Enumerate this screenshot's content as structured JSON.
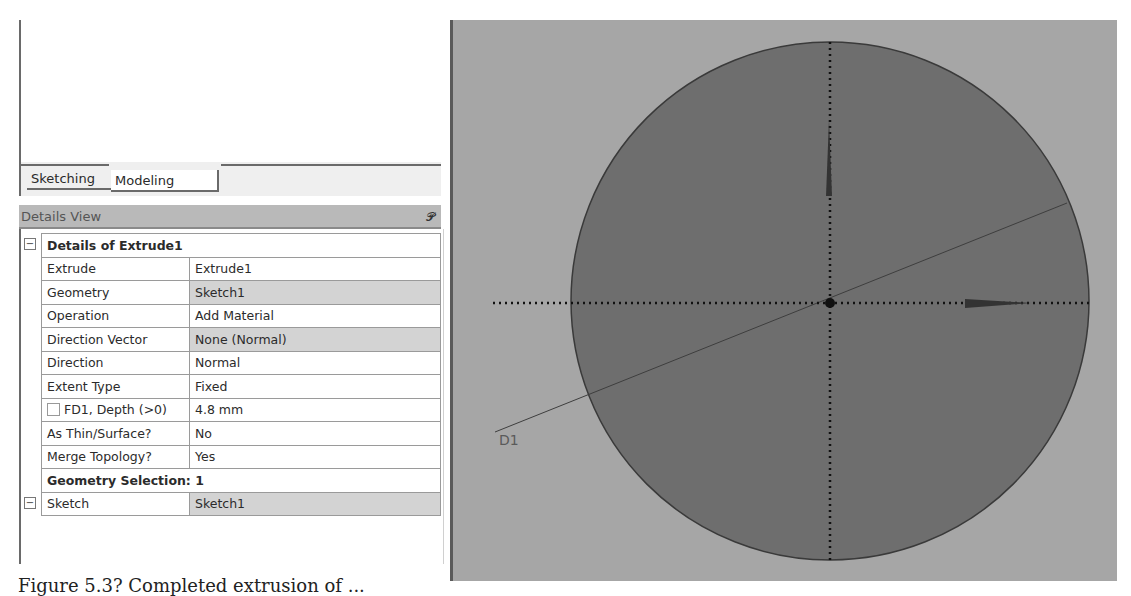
{
  "tabs": [
    {
      "label": "Sketching",
      "active": false
    },
    {
      "label": "Modeling",
      "active": true
    }
  ],
  "details_view": {
    "title": "Details View",
    "pin_icon": "pin-icon",
    "groups": [
      {
        "title": "Details of Extrude1",
        "expanded": true,
        "rows": [
          {
            "label": "Extrude",
            "value": "Extrude1",
            "shaded": false
          },
          {
            "label": "Geometry",
            "value": "Sketch1",
            "shaded": true
          },
          {
            "label": "Operation",
            "value": "Add Material",
            "shaded": false
          },
          {
            "label": "Direction Vector",
            "value": "None (Normal)",
            "shaded": true
          },
          {
            "label": "Direction",
            "value": "Normal",
            "shaded": false
          },
          {
            "label": "Extent Type",
            "value": "Fixed",
            "shaded": false
          },
          {
            "label": "FD1,  Depth (>0)",
            "value": "4.8 mm",
            "shaded": false,
            "checkbox": true
          },
          {
            "label": "As Thin/Surface?",
            "value": "No",
            "shaded": false
          },
          {
            "label": "Merge Topology?",
            "value": "Yes",
            "shaded": false
          }
        ]
      },
      {
        "title": "Geometry Selection: 1",
        "expanded": true,
        "rows": [
          {
            "label": "Sketch",
            "value": "Sketch1",
            "shaded": true
          }
        ]
      }
    ]
  },
  "graphics": {
    "dimension_label": "D1",
    "background_color": "#a6a6a6",
    "circle_fill": "#6e6e6e",
    "axis_icons": [
      "y-axis-arrow-icon",
      "x-axis-arrow-icon",
      "origin-point-icon"
    ]
  },
  "caption": "Figure 5.3? Completed extrusion of ..."
}
